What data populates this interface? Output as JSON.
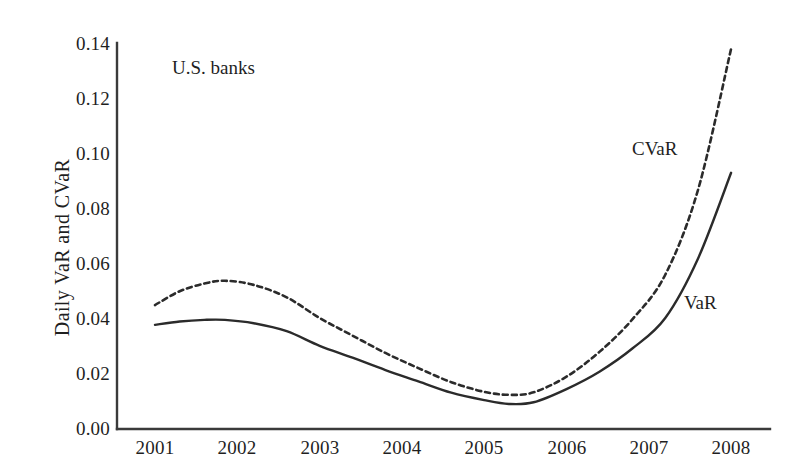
{
  "figure": {
    "width": 797,
    "height": 476,
    "background": "#ffffff",
    "ink_color": "#1f1f1f"
  },
  "axes": {
    "y_title": "Daily VaR and CVaR",
    "y_ticks": [
      "0.00",
      "0.02",
      "0.04",
      "0.06",
      "0.08",
      "0.10",
      "0.12",
      "0.14"
    ],
    "x_ticks": [
      "2001",
      "2002",
      "2003",
      "2004",
      "2005",
      "2006",
      "2007",
      "2008"
    ],
    "x_title": ""
  },
  "annotations": {
    "panel_label": "U.S. banks",
    "cvar_label": "CVaR",
    "var_label": "VaR"
  },
  "geometry": {
    "x_origin_px": 155,
    "x_step_px": 82.3,
    "y_zero_px": 429,
    "y_per_unit_px": 2755,
    "axis_left_px": 117,
    "axis_right_px": 770,
    "axis_top_px": 43
  },
  "chart_data": {
    "type": "line",
    "title": "",
    "subtitle": "",
    "xlabel": "",
    "ylabel": "Daily VaR and CVaR",
    "xlim": [
      2001,
      2008
    ],
    "ylim": [
      0.0,
      0.14
    ],
    "grid": false,
    "legend_position": "inline-annotations",
    "x": [
      2001.0,
      2001.3,
      2001.6,
      2001.85,
      2002.2,
      2002.6,
      2003.0,
      2003.4,
      2003.8,
      2004.2,
      2004.6,
      2005.0,
      2005.3,
      2005.6,
      2006.0,
      2006.4,
      2006.8,
      2007.2,
      2007.6,
      2008.0
    ],
    "series": [
      {
        "name": "CVaR",
        "style": "dashed",
        "color": "#2b2b2b",
        "values": [
          0.045,
          0.05,
          0.0528,
          0.0538,
          0.0523,
          0.0478,
          0.0403,
          0.0339,
          0.0276,
          0.0221,
          0.017,
          0.0135,
          0.0124,
          0.0133,
          0.019,
          0.028,
          0.0398,
          0.056,
          0.087,
          0.138
        ]
      },
      {
        "name": "VaR",
        "style": "solid",
        "color": "#2b2b2b",
        "values": [
          0.0378,
          0.039,
          0.0396,
          0.0396,
          0.0384,
          0.0355,
          0.0302,
          0.0259,
          0.0214,
          0.0173,
          0.0132,
          0.0105,
          0.0091,
          0.0097,
          0.0145,
          0.0208,
          0.0292,
          0.0403,
          0.062,
          0.093
        ]
      }
    ],
    "annotations": [
      {
        "text": "U.S. banks",
        "x": 2001.3,
        "y": 0.129
      },
      {
        "text": "CVaR",
        "x": 2006.8,
        "y": 0.102
      },
      {
        "text": "VaR",
        "x": 2007.5,
        "y": 0.047
      }
    ]
  }
}
